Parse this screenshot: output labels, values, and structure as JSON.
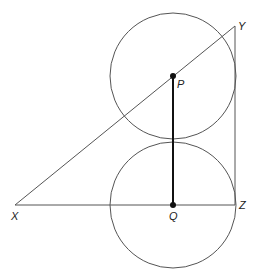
{
  "diagram": {
    "points": {
      "P": {
        "label": "P",
        "x": 173,
        "y": 76
      },
      "Q": {
        "label": "Q",
        "x": 173,
        "y": 205
      },
      "X": {
        "label": "X",
        "x": 15,
        "y": 205
      },
      "Y": {
        "label": "Y",
        "x": 235,
        "y": 26
      },
      "Z": {
        "label": "Z",
        "x": 235,
        "y": 205
      }
    },
    "circles": [
      {
        "center": "P",
        "radius": 63
      },
      {
        "center": "Q",
        "radius": 63
      }
    ],
    "segments": [
      [
        "X",
        "Y"
      ],
      [
        "Y",
        "Z"
      ],
      [
        "X",
        "Z"
      ],
      [
        "P",
        "Q"
      ]
    ],
    "colors": {
      "stroke": "#555555",
      "bold": "#111111"
    }
  }
}
